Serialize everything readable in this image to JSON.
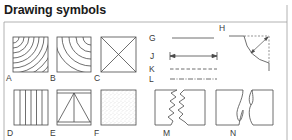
{
  "title": "Drawing symbols",
  "symbols": [
    {
      "id": "A",
      "label": "A",
      "depiction": "square with concentric arcs from top-left corner"
    },
    {
      "id": "B",
      "label": "B",
      "depiction": "square with concentric arcs from bottom-right corner"
    },
    {
      "id": "C",
      "label": "C",
      "depiction": "square with diagonal cross"
    },
    {
      "id": "D",
      "label": "D",
      "depiction": "square with vertical lines"
    },
    {
      "id": "E",
      "label": "E",
      "depiction": "square with triangle and center vertical line"
    },
    {
      "id": "F",
      "label": "F",
      "depiction": "square with stippled fill"
    },
    {
      "id": "G",
      "label": "G",
      "depiction": "solid line"
    },
    {
      "id": "H",
      "label": "H",
      "depiction": "curved arc with radius arrow"
    },
    {
      "id": "J",
      "label": "J",
      "depiction": "dimension line with end ticks and arrows"
    },
    {
      "id": "K",
      "label": "K",
      "depiction": "dashed line"
    },
    {
      "id": "L",
      "label": "L",
      "depiction": "dash-dot line"
    },
    {
      "id": "M",
      "label": "M",
      "depiction": "two boxes with zig-zag break edges"
    },
    {
      "id": "N",
      "label": "N",
      "depiction": "two boxes with curved break edges"
    }
  ],
  "colors": {
    "line": "#4a4a4a",
    "frame": "#9a9a9a",
    "text": "#1a1a1a"
  }
}
